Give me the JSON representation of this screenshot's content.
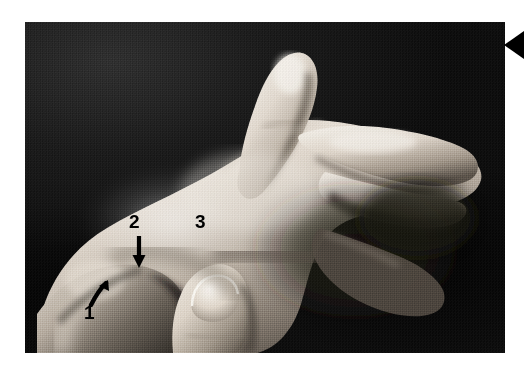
{
  "figure": {
    "type": "photograph",
    "view": "radial side view of a right hand, thumb extended upward, fingers curled",
    "rendering": "black-and-white halftone print",
    "background_color": "#ffffff",
    "photo": {
      "backdrop_color": "#141414",
      "skin_highlight_color": "#efeae2",
      "skin_midtone_color": "#b9b0a6",
      "skin_shadow_color": "#4e473f",
      "border_color": "#000000",
      "x": 25,
      "y": 22,
      "width": 480,
      "height": 331
    },
    "annotations": [
      {
        "id": "1",
        "label": "1",
        "color": "#000000",
        "marker": "arrow",
        "arrow_direction": "up-right",
        "arrow_name": "arrow-up-right-icon",
        "x": 59,
        "y": 281
      },
      {
        "id": "2",
        "label": "2",
        "color": "#000000",
        "marker": "arrow",
        "arrow_direction": "down",
        "arrow_name": "arrow-down-icon",
        "x": 104,
        "y": 190
      },
      {
        "id": "3",
        "label": "3",
        "color": "#000000",
        "marker": "none",
        "arrow_direction": "",
        "arrow_name": "",
        "x": 170,
        "y": 190
      }
    ],
    "edge_marker": {
      "name": "left-pointing-triangle",
      "color": "#000000",
      "direction": "left",
      "x": 504,
      "y": 31,
      "width": 20,
      "height": 28
    }
  }
}
